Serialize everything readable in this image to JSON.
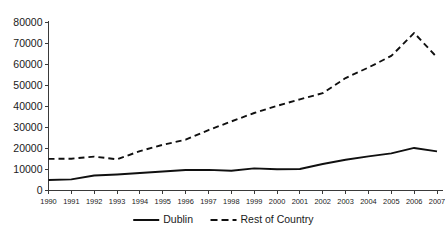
{
  "chart_data": {
    "type": "line",
    "title": "",
    "subtitle": "",
    "xlabel": "",
    "ylabel": "",
    "grid": false,
    "legend_position": "bottom-center",
    "categories": [
      "1990",
      "1991",
      "1992",
      "1993",
      "1994",
      "1995",
      "1996",
      "1997",
      "1998",
      "1999",
      "2000",
      "2001",
      "2002",
      "2003",
      "2004",
      "2005",
      "2006",
      "2007"
    ],
    "x": [
      1990,
      1991,
      1992,
      1993,
      1994,
      1995,
      1996,
      1997,
      1998,
      1999,
      2000,
      2001,
      2002,
      2003,
      2004,
      2005,
      2006,
      2007
    ],
    "xlim": [
      1990,
      2007
    ],
    "ylim": [
      0,
      80000
    ],
    "ytick_values": [
      0,
      10000,
      20000,
      30000,
      40000,
      50000,
      60000,
      70000,
      80000
    ],
    "ytick_labels": [
      "0",
      "10000",
      "20000",
      "30000",
      "40000",
      "50000",
      "60000",
      "70000",
      "80000"
    ],
    "series": [
      {
        "name": "Dublin",
        "style": "solid",
        "color": "#101010",
        "values": [
          5000,
          5300,
          7100,
          7600,
          8300,
          9000,
          9700,
          9800,
          9400,
          10500,
          10100,
          10200,
          12600,
          14600,
          16200,
          17600,
          20200,
          18600
        ]
      },
      {
        "name": "Rest of Country",
        "style": "dashed",
        "color": "#101010",
        "values": [
          15000,
          15100,
          16100,
          14800,
          18700,
          21700,
          24100,
          28700,
          32800,
          36800,
          40200,
          43300,
          46200,
          53400,
          58400,
          63900,
          74800,
          63200
        ]
      }
    ],
    "legend": [
      {
        "label": "Dublin",
        "style": "solid"
      },
      {
        "label": "Rest of Country",
        "style": "dashed"
      }
    ]
  }
}
